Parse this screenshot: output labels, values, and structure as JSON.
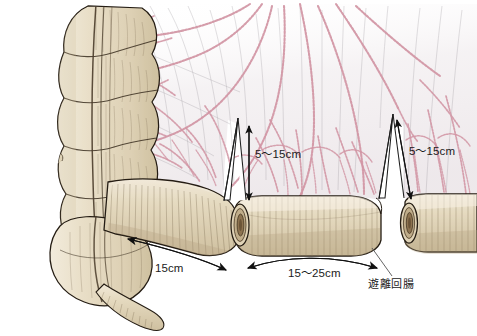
{
  "figure": {
    "background_color": "#ffffff",
    "bowel_fill": "#e6dcc3",
    "bowel_fill_light": "#f0e8d6",
    "bowel_outline": "#2a2118",
    "hatch_color": "#6d5c42",
    "vessel_color": "#d295a4",
    "vessel_color_dark": "#c07f92",
    "mesentery_tint": "#f4f1f2",
    "arrow_color": "#111111",
    "text_color": "#1b1b1b"
  },
  "labels": {
    "colon_to_resection": {
      "text": "15cm",
      "x": 155,
      "y": 263,
      "meaning": "distance from cecum to first bowel division"
    },
    "segment_length": {
      "text": "15～25cm",
      "x": 288,
      "y": 270,
      "meaning": "length of harvested ileal segment"
    },
    "mesentery_depth_left": {
      "text": "5～15cm",
      "x": 255,
      "y": 155,
      "meaning": "depth of mesenteric incision, left V"
    },
    "mesentery_depth_right": {
      "text": "5～15cm",
      "x": 409,
      "y": 152,
      "meaning": "depth of mesenteric incision, right V"
    },
    "free_ileum": {
      "text": "遊離回腸",
      "x": 368,
      "y": 281,
      "meaning": "mobilized / free ileum"
    }
  },
  "anatomy": {
    "ascending_colon": "ascending-colon-haustra",
    "cecum": "cecum",
    "appendix": "vermiform-appendix",
    "taenia": "taenia-coli",
    "terminal_ileum": "terminal-ileum",
    "harvested_segment": "ileal-graft-segment",
    "distal_ileum": "distal-ileum-stump",
    "mesentery": "small-bowel-mesentery",
    "vessels": "mesenteric-vascular-arcade",
    "cut_ends": [
      "cut-end-proximal",
      "cut-end-distal-left",
      "cut-end-distal-right"
    ]
  },
  "arrows": {
    "colon_measure": "curved-single-arrow-right",
    "segment_measure": "curved-double-arrow",
    "depth_left": "vertical-double-arrow",
    "depth_right": "vertical-double-arrow",
    "leader": "label-leader-line"
  }
}
